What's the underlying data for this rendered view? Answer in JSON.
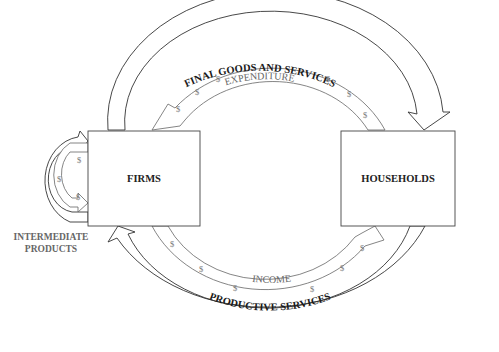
{
  "diagram": {
    "nodes": {
      "firms": "FIRMS",
      "households": "HOUSEHOLDS"
    },
    "flows": {
      "final_goods": "FINAL GOODS AND SERVICES",
      "expenditure": "EXPENDITURE",
      "income": "INCOME",
      "productive_services": "PRODUCTIVE SERVICES",
      "intermediate_line1": "INTERMEDIATE",
      "intermediate_line2": "PRODUCTS"
    },
    "money_symbol": "$",
    "colors": {
      "real_flow_outline": "#333333",
      "money_flow_outline": "#666666",
      "money_text": "#666666",
      "box_border": "#444444",
      "background": "#ffffff"
    }
  }
}
